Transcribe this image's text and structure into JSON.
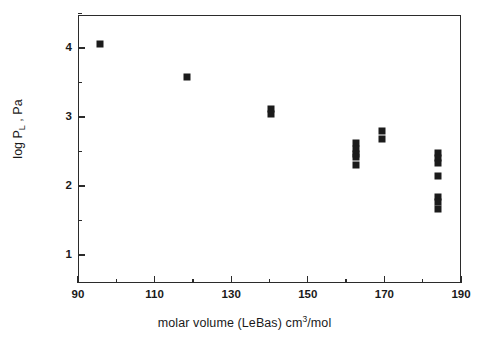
{
  "chart_data": {
    "type": "scatter",
    "title": "",
    "xlabel": "molar volume (LeBas) cm3/mol",
    "xlabel_parts": {
      "pre": "molar volume (LeBas) cm",
      "sup": "3",
      "post": "/mol"
    },
    "ylabel": "log PL , Pa",
    "ylabel_parts": {
      "pre": "log P",
      "sub": "L",
      "post": " , Pa"
    },
    "xlim": [
      90,
      190
    ],
    "ylim": [
      0.6,
      4.5
    ],
    "grid": false,
    "legend": null,
    "marker": {
      "shape": "square",
      "color": "#1b1b1b",
      "size_px": 7
    },
    "x_ticks_major": [
      90,
      110,
      130,
      150,
      170,
      190
    ],
    "x_ticks_minor": [
      100,
      120,
      140,
      160,
      180
    ],
    "x_ticklabels": [
      "90",
      "110",
      "130",
      "150",
      "170",
      "190"
    ],
    "y_ticks_major": [
      1,
      2,
      3,
      4
    ],
    "y_ticks_minor": [
      1.5,
      2.5,
      3.5,
      4.5
    ],
    "y_ticklabels": [
      "1",
      "2",
      "3",
      "4"
    ],
    "points": [
      {
        "x": 95.7,
        "y": 4.06
      },
      {
        "x": 118.5,
        "y": 3.58
      },
      {
        "x": 140.5,
        "y": 3.12
      },
      {
        "x": 140.5,
        "y": 3.04
      },
      {
        "x": 162.5,
        "y": 2.62
      },
      {
        "x": 162.5,
        "y": 2.54
      },
      {
        "x": 162.5,
        "y": 2.47
      },
      {
        "x": 162.5,
        "y": 2.42
      },
      {
        "x": 162.5,
        "y": 2.31
      },
      {
        "x": 169.5,
        "y": 2.8
      },
      {
        "x": 169.5,
        "y": 2.68
      },
      {
        "x": 184.0,
        "y": 2.48
      },
      {
        "x": 184.0,
        "y": 2.4
      },
      {
        "x": 184.0,
        "y": 2.33
      },
      {
        "x": 184.0,
        "y": 2.15
      },
      {
        "x": 184.0,
        "y": 1.84
      },
      {
        "x": 184.0,
        "y": 1.77
      },
      {
        "x": 184.0,
        "y": 1.67
      }
    ]
  }
}
